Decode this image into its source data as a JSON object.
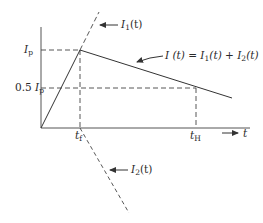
{
  "diagram": {
    "type": "current-vs-time waveform",
    "axes": {
      "x_label": "t",
      "y_levels": [
        {
          "label_main": "I",
          "label_sub": "p",
          "prefix": "",
          "level": "peak"
        },
        {
          "label_main": "I",
          "label_sub": "p",
          "prefix": "0.5 ",
          "level": "half-peak"
        }
      ],
      "x_ticks": [
        {
          "label_main": "t",
          "label_sub": "f",
          "meaning": "front time"
        },
        {
          "label_main": "t",
          "label_sub": "H",
          "meaning": "time to half value"
        }
      ]
    },
    "curves": {
      "i1": {
        "main": "I",
        "sub": "1",
        "suffix": "(t)",
        "style": "dashed"
      },
      "i2": {
        "main": "I",
        "sub": "2",
        "suffix": "(t)",
        "style": "dashed"
      },
      "total": {
        "text_a": "I (t) = I",
        "sub1": "1",
        "text_b": "(t) + I",
        "sub2": "2",
        "text_c": "(t)",
        "style": "solid"
      }
    },
    "colors": {
      "line": "#333333",
      "background": "#ffffff"
    }
  }
}
